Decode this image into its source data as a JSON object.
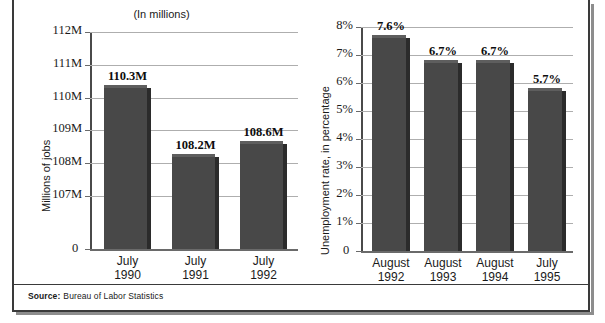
{
  "figure": {
    "source_label": "Source:",
    "source_value": "Bureau of Labor Statistics"
  },
  "chart_data": [
    {
      "id": "jobs",
      "type": "bar",
      "title": "(In millions)",
      "xlabel": "",
      "ylabel": "Millions of jobs",
      "categories": [
        "July 1990",
        "July 1991",
        "July 1992"
      ],
      "category_lines": [
        {
          "line1": "July",
          "line2": "1990"
        },
        {
          "line1": "July",
          "line2": "1991"
        },
        {
          "line1": "July",
          "line2": "1992"
        }
      ],
      "values": [
        110.3,
        108.2,
        108.6
      ],
      "value_labels": [
        "110.3M",
        "108.2M",
        "108.6M"
      ],
      "ylim": [
        106.5,
        112
      ],
      "axis_break": true,
      "ytick_values": [
        112,
        111,
        110,
        109,
        108,
        107,
        0
      ],
      "ytick_labels": [
        "112M",
        "111M",
        "110M",
        "109M",
        "108M",
        "107M",
        "0"
      ],
      "grid": true,
      "legend": "none",
      "bar_color": "#484848"
    },
    {
      "id": "unemployment",
      "type": "bar",
      "title": "",
      "xlabel": "",
      "ylabel": "Unemployment rate, in percentage",
      "categories": [
        "August 1992",
        "August 1993",
        "August 1994",
        "July 1995"
      ],
      "category_lines": [
        {
          "line1": "August",
          "line2": "1992"
        },
        {
          "line1": "August",
          "line2": "1993"
        },
        {
          "line1": "August",
          "line2": "1994"
        },
        {
          "line1": "July",
          "line2": "1995"
        }
      ],
      "values": [
        7.6,
        6.7,
        6.7,
        5.7
      ],
      "value_labels": [
        "7.6%",
        "6.7%",
        "6.7%",
        "5.7%"
      ],
      "ylim": [
        0,
        8
      ],
      "axis_break": false,
      "ytick_values": [
        8,
        7,
        6,
        5,
        4,
        3,
        2,
        1,
        0
      ],
      "ytick_labels": [
        "8%",
        "7%",
        "6%",
        "5%",
        "4%",
        "3%",
        "2%",
        "1%",
        "0"
      ],
      "grid": true,
      "legend": "none",
      "bar_color": "#484848"
    }
  ]
}
